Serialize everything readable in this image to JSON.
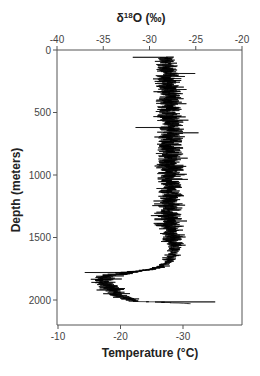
{
  "chart_data": {
    "type": "line",
    "title": "",
    "orientation": "vertical-profile",
    "top_axis": {
      "label_prefix": "δ",
      "label_sup": "18",
      "label_suffix": "O (‰)",
      "range": [
        -40,
        -20
      ],
      "ticks": [
        -40,
        -35,
        -30,
        -25,
        -20
      ],
      "tick_labels": [
        "-40",
        "-35",
        "-30",
        "-25",
        "-20"
      ]
    },
    "bottom_axis": {
      "label": "Temperature (°C)",
      "range": [
        -10,
        -40
      ],
      "ticks": [
        -10,
        -20,
        -30
      ],
      "tick_labels": [
        "-10",
        "-20",
        "-30"
      ]
    },
    "y_axis": {
      "label": "Depth (meters)",
      "range": [
        0,
        2200
      ],
      "inverted": true,
      "ticks": [
        0,
        500,
        1000,
        1500,
        2000
      ],
      "tick_labels": [
        "0",
        "500",
        "1000",
        "1500",
        "2000"
      ]
    },
    "grid": false,
    "legend": "none",
    "series": [
      {
        "name": "δ18O",
        "axis": "top",
        "color": "#000000",
        "description": "Noisy high-resolution ice-core isotope profile",
        "envelope": {
          "depth": [
            55,
            200,
            400,
            600,
            800,
            1000,
            1200,
            1400,
            1500,
            1550,
            1600,
            1650,
            1700,
            1750,
            1780,
            1800,
            1830,
            1860,
            1900,
            1950,
            1990,
            2010,
            2020,
            2030
          ],
          "mean": [
            -28.2,
            -28.0,
            -27.9,
            -27.9,
            -27.8,
            -27.7,
            -27.8,
            -27.9,
            -27.6,
            -27.2,
            -27.3,
            -27.6,
            -28.0,
            -29.5,
            -32.5,
            -34.0,
            -34.8,
            -35.0,
            -34.3,
            -33.5,
            -32.3,
            -31.6,
            -28.0,
            -25.4
          ],
          "spread": [
            1.6,
            1.8,
            2.0,
            2.1,
            2.1,
            2.1,
            2.1,
            2.1,
            2.0,
            1.4,
            1.1,
            1.0,
            1.0,
            1.2,
            2.0,
            2.0,
            2.2,
            2.2,
            2.0,
            1.8,
            1.4,
            1.2,
            0.8,
            0.3
          ]
        },
        "notable_points": [
          {
            "depth": 58,
            "value": -31.8
          },
          {
            "depth": 620,
            "value": -31.5
          },
          {
            "depth": 1780,
            "value": -37.0
          },
          {
            "depth": 2015,
            "value": -22.9
          }
        ]
      }
    ]
  }
}
